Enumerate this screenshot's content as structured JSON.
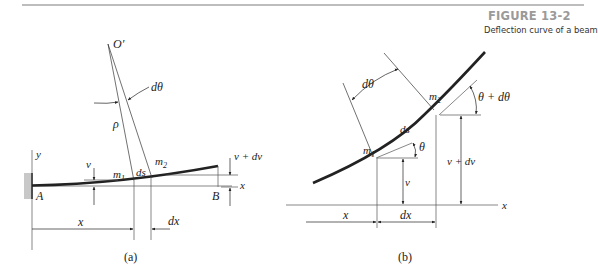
{
  "figure": {
    "number": "FIGURE 13-2",
    "caption": "Deflection curve of a beam"
  },
  "panel_a": {
    "label": "(a)",
    "labels": {
      "origin": "O′",
      "dtheta": "dθ",
      "rho": "ρ",
      "y_axis": "y",
      "x_axis": "x",
      "v": "v",
      "m1": "m",
      "m1_sub": "1",
      "m2": "m",
      "m2_sub": "2",
      "ds": "ds",
      "v_dv": "v + dv",
      "point_a": "A",
      "point_b": "B",
      "x_dim": "x",
      "dx_dim": "dx"
    }
  },
  "panel_b": {
    "label": "(b)",
    "labels": {
      "dtheta": "dθ",
      "m1": "m",
      "m1_sub": "1",
      "m2": "m",
      "m2_sub": "2",
      "ds": "ds",
      "theta": "θ",
      "theta_dtheta": "θ + dθ",
      "v": "v",
      "v_dv": "v + dv",
      "x_axis": "x",
      "x_dim": "x",
      "dx_dim": "dx"
    }
  }
}
